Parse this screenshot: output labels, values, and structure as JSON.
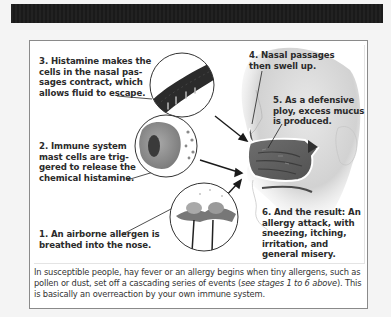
{
  "header": {
    "bar_color": "#1e1e1e"
  },
  "figure": {
    "steps": [
      {
        "number": 1,
        "text": "1. An airborne allergen is breathed into the nose."
      },
      {
        "number": 2,
        "text": "2. Immune system mast cells are triggered to release the chemical histamine."
      },
      {
        "number": 3,
        "text": "3. Histamine makes the cells in the nasal passages contract, which allows fluid to escape."
      },
      {
        "number": 4,
        "text": "4. Nasal passages then swell up."
      },
      {
        "number": 5,
        "text": "5. As a defensive ploy, excess mucus is produced."
      },
      {
        "number": 6,
        "text": "6. And the result: An allergy attack, with sneezing, itching, irritation, and general misery."
      }
    ],
    "label_lines": {
      "step1": [
        "1. An airborne allergen is",
        "breathed into the nose."
      ],
      "step2": [
        "2. Immune system",
        "mast cells are trig-",
        "gered to release the",
        "chemical histamine."
      ],
      "step3": [
        "3. Histamine makes the",
        "cells in the nasal pas-",
        "sages contract, which",
        "allows fluid to escape."
      ],
      "step4": [
        "4. Nasal passages",
        "then swell up."
      ],
      "step5": [
        "5. As a defensive",
        "ploy, excess mucus",
        "is produced."
      ],
      "step6": [
        "6. And the result: An",
        "allergy attack, with",
        "sneezing, itching,",
        "irritation, and",
        "general misery."
      ]
    },
    "illustrations": [
      {
        "name": "nasal-cell-closeup",
        "description": "Dark tubular nasal passage cells leaking fluid"
      },
      {
        "name": "mast-cell-closeup",
        "description": "Mast cell releasing histamine granules"
      },
      {
        "name": "flower-closeup",
        "description": "Flowers releasing pollen"
      },
      {
        "name": "nose-cross-section",
        "description": "Cross-section of human nose and nasal cavity"
      }
    ]
  },
  "caption": {
    "part1": "In susceptible people, hay fever or an allergy begins when tiny allergens, such as pollen or dust, set off a cascading series of events (",
    "italic": "see stages 1 to 6 above",
    "part2": "). This is basically an overreaction by your own immune system."
  }
}
